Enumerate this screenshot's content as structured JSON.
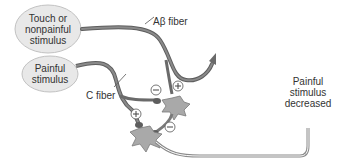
{
  "diagram": {
    "stimuli": [
      {
        "id": "touch",
        "label_lines": [
          "Touch or",
          "nonpainful",
          "stimulus"
        ]
      },
      {
        "id": "painful",
        "label_lines": [
          "Painful",
          "stimulus"
        ]
      }
    ],
    "fibers": [
      {
        "id": "abeta",
        "label": "Aβ fiber"
      },
      {
        "id": "c",
        "label": "C fiber"
      }
    ],
    "signs": {
      "plus": "+",
      "minus": "−"
    },
    "output_label_lines": [
      "Painful",
      "stimulus",
      "decreased"
    ],
    "colors": {
      "oval_fill": "#e6e6e6",
      "oval_stroke": "#bdbdbd",
      "fiber": "#6e6e6e",
      "neuron": "#a9a9a9",
      "text": "#333333"
    }
  }
}
